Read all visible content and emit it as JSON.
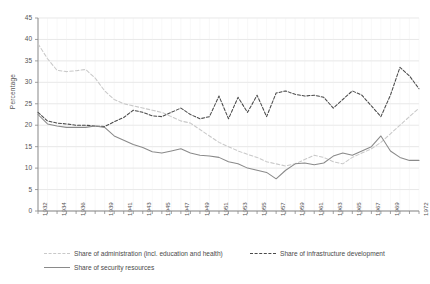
{
  "chart_data": {
    "type": "line",
    "title": "",
    "xlabel": "",
    "ylabel": "Percentage",
    "ylim": [
      0,
      45
    ],
    "ytick_step": 5,
    "yticks": [
      "0",
      "5",
      "10",
      "15",
      "20",
      "25",
      "30",
      "35",
      "40",
      "45"
    ],
    "grid": true,
    "legend_position": "bottom",
    "x": [
      1932,
      1933,
      1934,
      1935,
      1936,
      1937,
      1938,
      1939,
      1940,
      1941,
      1942,
      1943,
      1944,
      1945,
      1946,
      1947,
      1948,
      1949,
      1950,
      1951,
      1952,
      1953,
      1954,
      1955,
      1956,
      1957,
      1958,
      1959,
      1960,
      1961,
      1962,
      1963,
      1964,
      1965,
      1966,
      1967,
      1968,
      1969,
      1970,
      1971,
      1972
    ],
    "xtick_labels": [
      "1932",
      "",
      "1934",
      "",
      "1936",
      "",
      "",
      "1939",
      "",
      "1941",
      "",
      "1943",
      "",
      "1945",
      "",
      "1947",
      "",
      "1949",
      "",
      "1951",
      "",
      "1953",
      "",
      "1955",
      "",
      "1957",
      "",
      "1959",
      "",
      "1961",
      "",
      "1963",
      "",
      "1965",
      "",
      "1967",
      "",
      "1969",
      "",
      "",
      "1972"
    ],
    "xtick_labels_shown": [
      "1932",
      "1934",
      "1936",
      "1939",
      "1941",
      "1943",
      "1945",
      "1947",
      "1949",
      "1951",
      "1953",
      "1955",
      "1957",
      "1959",
      "1961",
      "1963",
      "1965",
      "1967",
      "1969",
      "1972"
    ],
    "series": [
      {
        "name": "Share of administration (incl. education and health)",
        "style": "dashed",
        "color": "#c9c9c9",
        "values": [
          39.0,
          35.5,
          32.8,
          32.5,
          32.7,
          33.0,
          31.0,
          28.0,
          26.0,
          25.0,
          24.5,
          24.0,
          23.5,
          23.0,
          22.0,
          21.0,
          20.5,
          19.0,
          17.5,
          16.0,
          15.0,
          14.0,
          13.2,
          12.5,
          11.5,
          11.0,
          10.5,
          11.0,
          12.0,
          13.0,
          12.5,
          11.5,
          11.0,
          12.5,
          13.5,
          14.5,
          16.0,
          18.0,
          20.0,
          22.0,
          24.0
        ]
      },
      {
        "name": "Share of infrastructure development",
        "style": "dashed",
        "color": "#4a4a4a",
        "values": [
          23.0,
          21.0,
          20.5,
          20.3,
          20.0,
          20.0,
          19.8,
          19.7,
          20.8,
          21.8,
          23.5,
          23.0,
          22.2,
          22.0,
          23.0,
          24.0,
          22.5,
          21.5,
          22.0,
          26.8,
          21.5,
          26.5,
          23.0,
          27.0,
          22.0,
          27.5,
          28.0,
          27.2,
          26.8,
          27.0,
          26.5,
          24.0,
          26.0,
          28.0,
          27.0,
          24.5,
          22.0,
          27.0,
          33.5,
          31.5,
          28.5
        ]
      },
      {
        "name": "Share of security resources",
        "style": "solid",
        "color": "#8a8a8a",
        "values": [
          22.5,
          20.3,
          19.8,
          19.5,
          19.5,
          19.5,
          19.8,
          19.5,
          17.5,
          16.5,
          15.5,
          14.8,
          13.8,
          13.5,
          14.0,
          14.5,
          13.5,
          13.0,
          12.8,
          12.5,
          11.5,
          11.0,
          10.0,
          9.5,
          9.0,
          7.5,
          9.5,
          11.0,
          11.2,
          10.8,
          11.2,
          12.8,
          13.5,
          13.0,
          14.0,
          15.0,
          17.5,
          14.0,
          12.5,
          11.8,
          11.8
        ]
      }
    ]
  },
  "legend": {
    "entries": [
      {
        "label": "Share of administration (incl. education and health)",
        "color": "#c9c9c9",
        "style": "dashed"
      },
      {
        "label": "Share of infrastructure development",
        "color": "#4a4a4a",
        "style": "dashed"
      },
      {
        "label": "Share of security resources",
        "color": "#8a8a8a",
        "style": "solid"
      }
    ]
  }
}
